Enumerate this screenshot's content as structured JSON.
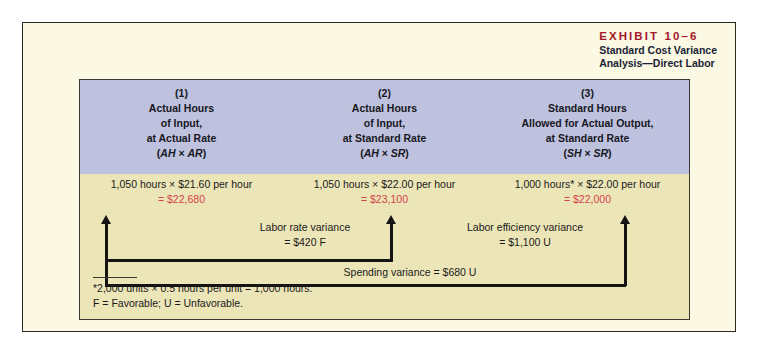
{
  "exhibit": {
    "number": "EXHIBIT 10–6",
    "subtitle_line1": "Standard Cost Variance",
    "subtitle_line2": "Analysis—Direct Labor",
    "number_color": "#a4162a",
    "subtitle_color": "#1a1f35",
    "panel_bg": "#fbf8e3",
    "header_band_bg": "#bec2df",
    "body_bg": "#ece5b8",
    "result_color": "#d4434c"
  },
  "columns": [
    {
      "number": "(1)",
      "line1": "Actual Hours",
      "line2": "of Input,",
      "line3": "at Actual Rate",
      "formula_open": "(",
      "formula_a": "AH",
      "formula_op": " × ",
      "formula_b": "AR",
      "formula_close": ")",
      "expr": "1,050 hours  ×  $21.60 per hour",
      "result": "= $22,680"
    },
    {
      "number": "(2)",
      "line1": "Actual Hours",
      "line2": "of Input,",
      "line3": "at Standard Rate",
      "formula_open": "(",
      "formula_a": "AH",
      "formula_op": " × ",
      "formula_b": "SR",
      "formula_close": ")",
      "expr": "1,050 hours  ×  $22.00 per hour",
      "result": "= $23,100"
    },
    {
      "number": "(3)",
      "line1": "Standard Hours",
      "line2": "Allowed for Actual Output,",
      "line3": "at Standard Rate",
      "formula_open": "(",
      "formula_a": "SH",
      "formula_op": " × ",
      "formula_b": "SR",
      "formula_close": ")",
      "expr": "1,000 hours*  ×  $22.00 per hour",
      "result": "= $22,000"
    }
  ],
  "variances": {
    "labor_rate": {
      "label": "Labor rate variance",
      "value": "= $420 F"
    },
    "labor_efficiency": {
      "label": "Labor efficiency variance",
      "value": "= $1,100 U"
    },
    "spending": {
      "label": "Spending variance = $680 U"
    }
  },
  "footnote": {
    "line1": "*2,000 units × 0.5 hours per unit = 1,000 hours.",
    "line2": "F = Favorable; U = Unfavorable."
  }
}
